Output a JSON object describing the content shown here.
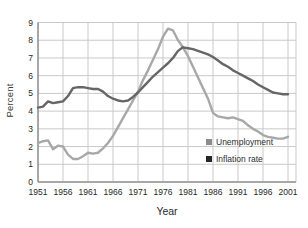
{
  "chart_data": {
    "type": "line",
    "title": "",
    "xlabel": "Year",
    "ylabel": "Percent",
    "xlim": [
      1951,
      2001
    ],
    "ylim": [
      0,
      9
    ],
    "grid": true,
    "legend_position": "inside-bottom-right",
    "x_ticks": [
      1951,
      1956,
      1961,
      1966,
      1971,
      1976,
      1981,
      1986,
      1991,
      1996,
      2001
    ],
    "y_ticks": [
      0,
      1,
      2,
      3,
      4,
      5,
      6,
      7,
      8,
      9
    ],
    "x": [
      1951,
      1952,
      1953,
      1954,
      1955,
      1956,
      1957,
      1958,
      1959,
      1960,
      1961,
      1962,
      1963,
      1964,
      1965,
      1966,
      1967,
      1968,
      1969,
      1970,
      1971,
      1972,
      1973,
      1974,
      1975,
      1976,
      1977,
      1978,
      1979,
      1980,
      1981,
      1982,
      1983,
      1984,
      1985,
      1986,
      1987,
      1988,
      1989,
      1990,
      1991,
      1992,
      1993,
      1994,
      1995,
      1996,
      1997,
      1998,
      1999,
      2000,
      2001
    ],
    "series": [
      {
        "name": "Unemployment",
        "color": "#a8a8a8",
        "values": [
          2.2,
          2.3,
          2.35,
          1.85,
          2.05,
          2.0,
          1.55,
          1.3,
          1.3,
          1.45,
          1.65,
          1.6,
          1.65,
          1.9,
          2.2,
          2.6,
          3.1,
          3.6,
          4.1,
          4.6,
          5.1,
          5.75,
          6.3,
          6.9,
          7.5,
          8.2,
          8.65,
          8.55,
          8.0,
          7.6,
          7.1,
          6.5,
          5.9,
          5.3,
          4.7,
          3.9,
          3.7,
          3.65,
          3.6,
          3.65,
          3.55,
          3.45,
          3.2,
          3.0,
          2.85,
          2.65,
          2.55,
          2.5,
          2.45,
          2.45,
          2.55
        ]
      },
      {
        "name": "Inflation rate",
        "color": "#666666",
        "values": [
          4.2,
          4.25,
          4.55,
          4.45,
          4.5,
          4.55,
          4.85,
          5.3,
          5.35,
          5.35,
          5.3,
          5.25,
          5.25,
          5.1,
          4.85,
          4.7,
          4.6,
          4.55,
          4.6,
          4.8,
          5.05,
          5.35,
          5.65,
          5.95,
          6.2,
          6.45,
          6.7,
          7.0,
          7.4,
          7.6,
          7.55,
          7.5,
          7.4,
          7.3,
          7.2,
          7.05,
          6.85,
          6.65,
          6.5,
          6.3,
          6.15,
          6.0,
          5.85,
          5.7,
          5.5,
          5.35,
          5.2,
          5.05,
          5.0,
          4.95,
          4.95
        ]
      }
    ],
    "legend": {
      "items": [
        {
          "label": "Unemployment",
          "swatch_color": "#8c8c8c"
        },
        {
          "label": "Inflation rate",
          "swatch_color": "#262626"
        }
      ]
    }
  },
  "colors": {
    "background": "#ffffff",
    "grid": "#c9c9c9",
    "axis": "#8a8a8a",
    "tick_text": "#1f1f1f"
  }
}
